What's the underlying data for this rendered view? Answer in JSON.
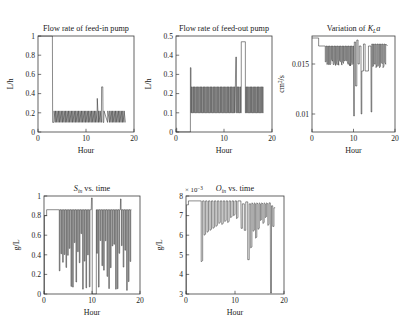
{
  "figure": {
    "xlabel": "Hour",
    "xticks": [
      "0",
      "10",
      "20"
    ],
    "xlim": [
      0,
      20
    ]
  },
  "chart_data": [
    {
      "id": "feed-in-pump",
      "type": "line",
      "title": "Flow rate of feed-in pump",
      "title_parts": [
        {
          "t": "Flow rate of feed-in pump",
          "s": "normal"
        }
      ],
      "xlabel": "Hour",
      "ylabel": "L/h",
      "xlim": [
        0,
        20
      ],
      "ylim": [
        0,
        1
      ],
      "xticks": [
        "0",
        "10",
        "20"
      ],
      "xtickvals": [
        0,
        10,
        20
      ],
      "yticks": [
        "0",
        "0.2",
        "0.4",
        "0.6",
        "0.8",
        "1"
      ],
      "ytickvals": [
        0,
        0.2,
        0.4,
        0.6,
        0.8,
        1
      ],
      "grid": false,
      "legend": "none",
      "baseline": 0.1,
      "pulse_high": 0.22,
      "x": [
        0,
        3.0,
        3.05,
        3.3,
        3.35,
        3.6,
        3.65,
        3.9,
        3.95,
        4.2,
        4.25,
        4.5,
        4.55,
        4.8,
        4.85,
        5.1,
        5.15,
        5.4,
        5.45,
        5.7,
        5.75,
        6.0,
        6.05,
        6.3,
        6.35,
        6.6,
        6.65,
        6.9,
        6.95,
        7.2,
        7.25,
        7.5,
        7.55,
        7.8,
        7.85,
        8.1,
        8.15,
        8.4,
        8.45,
        8.7,
        8.75,
        9.0,
        9.05,
        9.3,
        9.35,
        9.6,
        9.65,
        9.9,
        9.95,
        10.2,
        10.25,
        10.5,
        10.55,
        10.8,
        10.85,
        11.1,
        11.15,
        11.4,
        11.45,
        11.7,
        11.75,
        12.0,
        12.05,
        12.3,
        12.35,
        12.6,
        12.65,
        12.9,
        12.95,
        13.2,
        13.25,
        13.5,
        13.55,
        13.7,
        13.75,
        14.5,
        14.55,
        14.9,
        14.95,
        15.2,
        15.25,
        15.5,
        15.55,
        15.8,
        15.85,
        16.1,
        16.15,
        16.4,
        16.45,
        16.7,
        16.75,
        17.0,
        17.05,
        17.3,
        17.35,
        17.6,
        17.65,
        17.9,
        17.95,
        18.2
      ],
      "values": [
        1,
        1,
        0.1,
        0.1,
        0.22,
        0.1,
        0.22,
        0.1,
        0.22,
        0.1,
        0.22,
        0.1,
        0.22,
        0.1,
        0.22,
        0.1,
        0.22,
        0.1,
        0.22,
        0.1,
        0.22,
        0.1,
        0.22,
        0.1,
        0.22,
        0.1,
        0.22,
        0.1,
        0.22,
        0.1,
        0.22,
        0.1,
        0.22,
        0.1,
        0.22,
        0.1,
        0.22,
        0.1,
        0.22,
        0.1,
        0.22,
        0.1,
        0.22,
        0.1,
        0.22,
        0.1,
        0.22,
        0.1,
        0.22,
        0.1,
        0.22,
        0.1,
        0.22,
        0.1,
        0.22,
        0.1,
        0.22,
        0.1,
        0.22,
        0.1,
        0.22,
        0.1,
        0.22,
        0.1,
        0.35,
        0.1,
        0.22,
        0.1,
        0.22,
        0.1,
        0.47,
        0.47,
        0.1,
        0.1,
        0.22,
        0.1,
        0.22,
        0.1,
        0.22,
        0.1,
        0.22,
        0.1,
        0.22,
        0.1,
        0.22,
        0.1,
        0.22,
        0.1,
        0.22,
        0.1,
        0.22,
        0.1,
        0.22,
        0.1,
        0.22,
        0.1,
        0.22,
        0.1,
        0.22,
        0.1
      ]
    },
    {
      "id": "feed-out-pump",
      "type": "line",
      "title": "Flow rate of feed-out pump",
      "xlabel": "Hour",
      "ylabel": "L/h",
      "xlim": [
        0,
        20
      ],
      "ylim": [
        0,
        0.5
      ],
      "xticks": [
        "0",
        "10",
        "20"
      ],
      "xtickvals": [
        0,
        10,
        20
      ],
      "yticks": [
        "0",
        "0.1",
        "0.2",
        "0.3",
        "0.4",
        "0.5"
      ],
      "ytickvals": [
        0,
        0.1,
        0.2,
        0.3,
        0.4,
        0.5
      ],
      "grid": false,
      "legend": "none",
      "baseline": 0.1,
      "pulse_high": 0.235
    },
    {
      "id": "kla-variation",
      "type": "line",
      "title": "Variation of KLa",
      "title_math": {
        "pre": "Variation of ",
        "sym": "K",
        "sub": "L",
        "post": "a"
      },
      "xlabel": "Hour",
      "ylabel": "cm2/s",
      "ylabel_parts": {
        "pre": "cm",
        "sup": "2",
        "post": "/s"
      },
      "xlim": [
        0,
        20
      ],
      "ylim": [
        0.0082,
        0.0178
      ],
      "xticks": [
        "0",
        "10",
        "20"
      ],
      "xtickvals": [
        0,
        10,
        20
      ],
      "yticks": [
        "0.01",
        "0.015"
      ],
      "ytickvals": [
        0.01,
        0.015
      ],
      "grid": false,
      "legend": "none",
      "baseline": 0.0168,
      "top": 0.0176
    },
    {
      "id": "sin-vs-time",
      "type": "line",
      "title": "Sin vs. time",
      "title_math": {
        "sym": "S",
        "sub": "in",
        "post": " vs. time"
      },
      "xlabel": "Hour",
      "ylabel": "g/L",
      "xlim": [
        0,
        20
      ],
      "ylim": [
        0,
        1
      ],
      "xticks": [
        "0",
        "10",
        "20"
      ],
      "xtickvals": [
        0,
        10,
        20
      ],
      "yticks": [
        "0",
        "0.2",
        "0.4",
        "0.6",
        "0.8",
        "1"
      ],
      "ytickvals": [
        0,
        0.2,
        0.4,
        0.6,
        0.8,
        1
      ],
      "grid": false,
      "legend": "none",
      "baseline": 0.86
    },
    {
      "id": "oin-vs-time",
      "type": "line",
      "title": "Oin vs. time",
      "title_math": {
        "sym": "O",
        "sub": "in",
        "post": " vs. time"
      },
      "xlabel": "Hour",
      "ylabel": "g/L",
      "exponent": "× 10",
      "exponent_power": "−3",
      "xlim": [
        0,
        20
      ],
      "ylim": [
        3,
        8
      ],
      "xticks": [
        "0",
        "10",
        "20"
      ],
      "xtickvals": [
        0,
        10,
        20
      ],
      "yticks": [
        "3",
        "4",
        "5",
        "6",
        "7",
        "8"
      ],
      "ytickvals": [
        3,
        4,
        5,
        6,
        7,
        8
      ],
      "grid": false,
      "legend": "none",
      "baseline": 7.75
    }
  ]
}
